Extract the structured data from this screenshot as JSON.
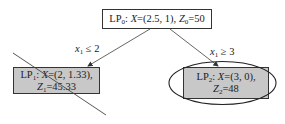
{
  "diagram": {
    "type": "branch-and-bound-tree",
    "nodes": {
      "root": {
        "label_prefix": "LP",
        "label_sub": "0",
        "x_label": "X",
        "x_value": "=(2.5, 1), ",
        "z_label": "Z",
        "z_sub": "0",
        "z_value": "=50"
      },
      "left": {
        "label_prefix": "LP",
        "label_sub": "1",
        "x_label": "X",
        "x_value": "=(2, 1.33),",
        "z_label": "Z",
        "z_sub": "1",
        "z_value": "=45.33",
        "status": "pruned"
      },
      "right": {
        "label_prefix": "LP",
        "label_sub": "2",
        "x_label": "X",
        "x_value": "=(3, 0),",
        "z_label": "Z",
        "z_sub": "2",
        "z_value": "=48",
        "status": "optimal"
      }
    },
    "edges": {
      "left": {
        "var": "x",
        "sub": "1",
        "op": " ≤ 2"
      },
      "right": {
        "var": "x",
        "sub": "1",
        "op": " ≥ 3"
      }
    },
    "colors": {
      "node_fill_child": "#c8c8c8",
      "node_fill_root": "#ffffff",
      "line": "#333333"
    }
  }
}
